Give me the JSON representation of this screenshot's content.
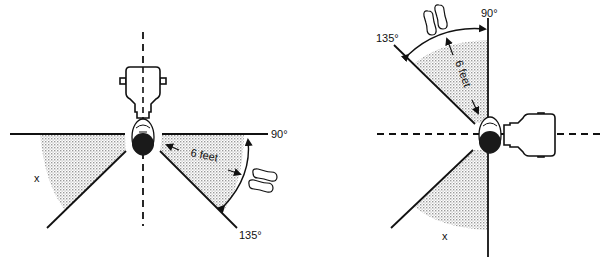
{
  "diagrams": [
    {
      "id": "left",
      "labels": {
        "angle_90": "90°",
        "angle_135": "135°",
        "distance": "6 feet",
        "zone": "x"
      }
    },
    {
      "id": "right",
      "labels": {
        "angle_90": "90°",
        "angle_135": "135°",
        "distance": "6 feet",
        "zone": "x"
      }
    }
  ],
  "colors": {
    "line": "#111111",
    "shading": "#c8c8c8",
    "background": "#ffffff"
  }
}
